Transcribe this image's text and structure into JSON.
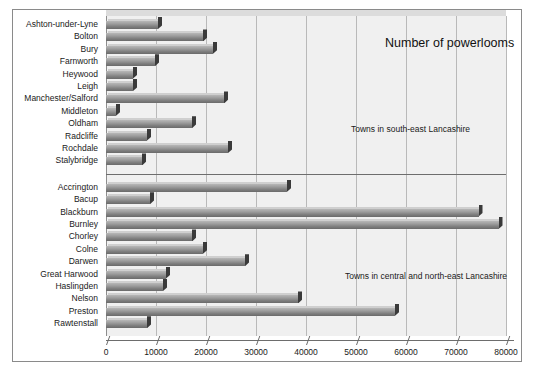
{
  "chart_data": {
    "type": "bar",
    "orientation": "horizontal",
    "title": "Number of powerlooms",
    "xlabel": "",
    "ylabel": "",
    "xlim": [
      0,
      80000
    ],
    "xticks": [
      0,
      10000,
      20000,
      30000,
      40000,
      50000,
      60000,
      70000,
      80000
    ],
    "xtick_labels": [
      "0",
      "10000",
      "20000",
      "30000",
      "40000",
      "50000",
      "60000",
      "70000",
      "80000"
    ],
    "grid": true,
    "legend": "none",
    "bar_color": "#8e8e8e",
    "plot_background": "#f0f0f0",
    "groups": [
      {
        "annotation": "Towns in south-east Lancashire",
        "categories": [
          "Ashton-under-Lyne",
          "Bolton",
          "Bury",
          "Farnworth",
          "Heywood",
          "Leigh",
          "Manchester/Salford",
          "Middleton",
          "Oldham",
          "Radcliffe",
          "Rochdale",
          "Stalybridge"
        ],
        "values": [
          10400,
          19400,
          21400,
          9800,
          5400,
          5400,
          23600,
          2000,
          17200,
          8200,
          24400,
          7200
        ]
      },
      {
        "annotation": "Towns in central and north-east Lancashire",
        "categories": [
          "Accrington",
          "Bacup",
          "Blackburn",
          "Burnley",
          "Chorley",
          "Colne",
          "Darwen",
          "Great Harwood",
          "Haslingden",
          "Nelson",
          "Preston",
          "Rawtenstall"
        ],
        "values": [
          36200,
          8800,
          74500,
          78500,
          17200,
          19400,
          27800,
          12000,
          11400,
          38400,
          57800,
          8200
        ]
      }
    ]
  }
}
